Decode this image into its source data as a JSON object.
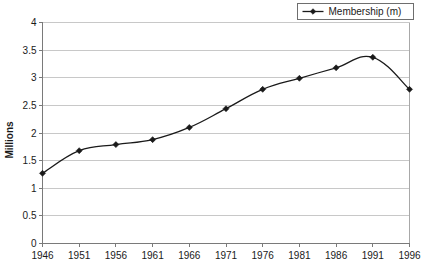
{
  "chart_data": {
    "type": "line",
    "title": "",
    "xlabel": "",
    "ylabel": "Millions",
    "x": [
      1946,
      1951,
      1956,
      1961,
      1966,
      1971,
      1976,
      1981,
      1986,
      1991,
      1996
    ],
    "xtick_labels": [
      "1946",
      "1951",
      "1956",
      "1961",
      "1966",
      "1971",
      "1976",
      "1981",
      "1986",
      "1991",
      "1996"
    ],
    "ytick_labels": [
      "0",
      "0.5",
      "1",
      "1.5",
      "2",
      "2.5",
      "3",
      "3.5",
      "4"
    ],
    "ytick_values": [
      0,
      0.5,
      1,
      1.5,
      2,
      2.5,
      3,
      3.5,
      4
    ],
    "xlim": [
      1946,
      1996
    ],
    "ylim": [
      0,
      4
    ],
    "grid": "horizontal",
    "legend_position": "top-right",
    "series": [
      {
        "name": "Membership (m)",
        "values": [
          1.27,
          1.68,
          1.79,
          1.88,
          2.1,
          2.44,
          2.79,
          2.99,
          3.18,
          3.37,
          2.79
        ],
        "color": "#1a1a1a",
        "marker": "diamond"
      }
    ]
  },
  "legend": {
    "entries": [
      {
        "label": "Membership (m)"
      }
    ]
  },
  "axes": {
    "y_title": "Millions"
  },
  "colors": {
    "series": "#1a1a1a",
    "gridline": "#c8c8c8",
    "axis": "#7a7a7a",
    "text": "#1a1a1a",
    "background": "#ffffff"
  }
}
